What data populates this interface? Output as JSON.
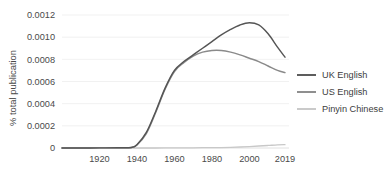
{
  "chart_data": {
    "type": "line",
    "title": "",
    "subtitle": "",
    "xlabel": "",
    "ylabel": "% total publication",
    "xlim": [
      1900,
      2019
    ],
    "ylim": [
      0,
      0.0012
    ],
    "grid": true,
    "legend_position": "right",
    "xticks": [
      "1920",
      "1940",
      "1960",
      "1980",
      "2000",
      "2019"
    ],
    "xtick_values": [
      1920,
      1940,
      1960,
      1980,
      2000,
      2019
    ],
    "yticks": [
      "0",
      "0.0002",
      "0.0004",
      "0.0006",
      "0.0008",
      "0.0010",
      "0.0012"
    ],
    "ytick_values": [
      0,
      0.0002,
      0.0004,
      0.0006,
      0.0008,
      0.001,
      0.0012
    ],
    "x": [
      1900,
      1910,
      1920,
      1930,
      1937,
      1940,
      1945,
      1950,
      1955,
      1960,
      1965,
      1970,
      1975,
      1980,
      1985,
      1990,
      1995,
      2000,
      2005,
      2010,
      2015,
      2019
    ],
    "series": [
      {
        "name": "UK English",
        "color": "#555555",
        "values": [
          0.0,
          0.0,
          1e-06,
          2e-06,
          5e-06,
          3e-05,
          0.00014,
          0.00033,
          0.00054,
          0.0007,
          0.00078,
          0.00084,
          0.0009,
          0.00096,
          0.00102,
          0.00107,
          0.00111,
          0.00113,
          0.00111,
          0.00103,
          0.00091,
          0.00082
        ]
      },
      {
        "name": "US English",
        "color": "#8a8a8a",
        "values": [
          0.0,
          0.0,
          1e-06,
          2e-06,
          5e-06,
          2.8e-05,
          0.00013,
          0.00032,
          0.00053,
          0.00069,
          0.00077,
          0.00083,
          0.000865,
          0.00088,
          0.00088,
          0.000865,
          0.00084,
          0.00081,
          0.00078,
          0.00074,
          0.0007,
          0.00068
        ]
      },
      {
        "name": "Pinyin Chinese",
        "color": "#c8c8c8",
        "values": [
          0.0,
          0.0,
          0.0,
          0.0,
          0.0,
          0.0,
          0.0,
          0.0,
          5e-07,
          1e-06,
          1.5e-06,
          2e-06,
          2.5e-06,
          3e-06,
          4e-06,
          6e-06,
          9e-06,
          1.3e-05,
          1.8e-05,
          2.3e-05,
          2.8e-05,
          3e-05
        ]
      }
    ]
  },
  "legend": {
    "items": [
      {
        "label": "UK English"
      },
      {
        "label": "US English"
      },
      {
        "label": "Pinyin Chinese"
      }
    ]
  },
  "axes": {
    "y_title": "% total publication"
  },
  "colors": {
    "uk_english": "#555555",
    "us_english": "#8a8a8a",
    "pinyin_chinese": "#c8c8c8",
    "gridline": "#ededed",
    "background": "#ffffff",
    "text": "#3d3d3d"
  }
}
